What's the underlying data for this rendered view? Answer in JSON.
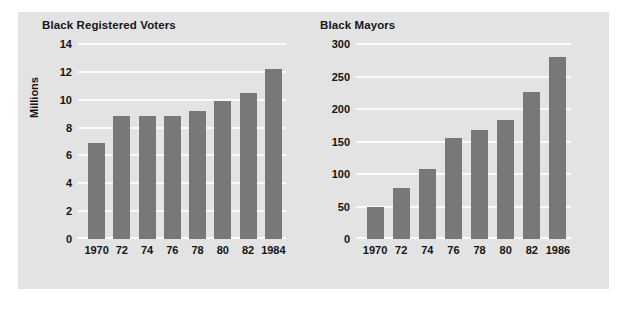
{
  "figure": {
    "background_color": "#ffffff",
    "panel_color": "#e3e3e3",
    "bar_color": "#787878",
    "gridline_color": "#fafafa",
    "text_color": "#141414"
  },
  "chart_data": [
    {
      "type": "bar",
      "title": "Black Registered Voters",
      "xlabel": "",
      "ylabel": "Millions",
      "categories": [
        "1970",
        "72",
        "74",
        "76",
        "78",
        "80",
        "82",
        "1984"
      ],
      "values": [
        6.9,
        8.8,
        8.8,
        8.8,
        9.2,
        9.9,
        10.5,
        12.2
      ],
      "yticks": [
        "0",
        "2",
        "4",
        "6",
        "8",
        "10",
        "12",
        "14"
      ],
      "ytick_values": [
        0,
        2,
        4,
        6,
        8,
        10,
        12,
        14
      ],
      "ylim": [
        0,
        14
      ],
      "grid": true,
      "legend": "none"
    },
    {
      "type": "bar",
      "title": "Black Mayors",
      "xlabel": "",
      "ylabel": "",
      "categories": [
        "1970",
        "72",
        "74",
        "76",
        "78",
        "80",
        "82",
        "1986"
      ],
      "values": [
        50,
        79,
        108,
        156,
        167,
        183,
        226,
        280
      ],
      "yticks": [
        "0",
        "50",
        "100",
        "150",
        "200",
        "250",
        "300"
      ],
      "ytick_values": [
        0,
        50,
        100,
        150,
        200,
        250,
        300
      ],
      "ylim": [
        0,
        300
      ],
      "grid": true,
      "legend": "none"
    }
  ]
}
